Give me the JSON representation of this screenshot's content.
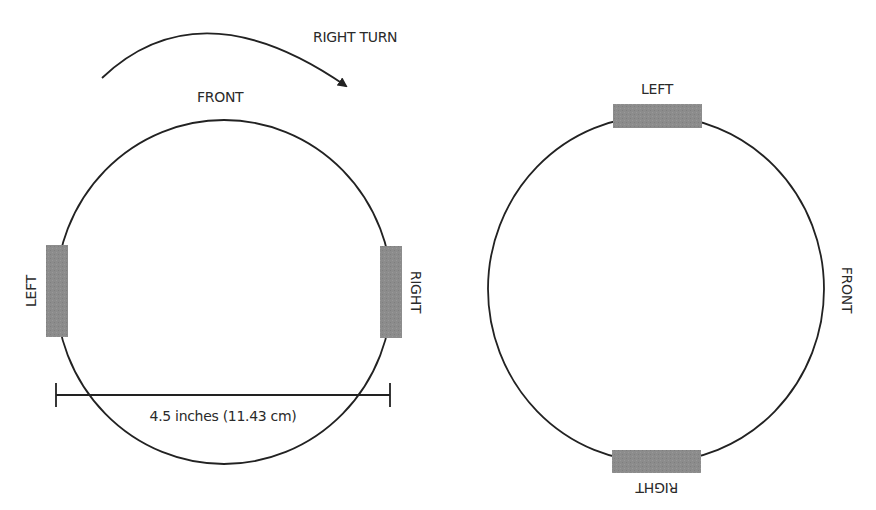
{
  "top_cutoff_text": "…",
  "left_diagram": {
    "turn_label": "RIGHT TURN",
    "front_label": "FRONT",
    "left_label": "LEFT",
    "right_label": "RIGHT",
    "dimension_label": "4.5 inches (11.43 cm)"
  },
  "right_diagram": {
    "left_label": "LEFT",
    "right_label": "RIGHT",
    "front_label": "FRONT"
  },
  "colors": {
    "stroke": "#222222",
    "wheel_fill": "#8c8c8c"
  }
}
